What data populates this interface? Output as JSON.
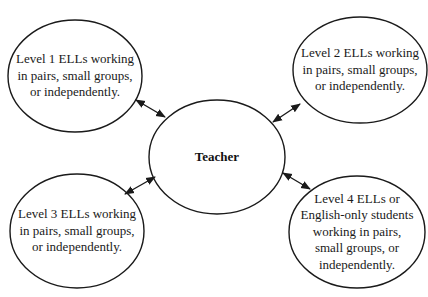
{
  "diagram": {
    "type": "hub-and-spoke",
    "stroke_color": "#1a1a1a",
    "background": "#ffffff",
    "center": {
      "label": "Teacher",
      "cx": 217,
      "cy": 157,
      "rx": 68,
      "ry": 57
    },
    "nodes": [
      {
        "id": "level-1",
        "lines": [
          "Level 1 ELLs working",
          "in pairs, small groups,",
          "or independently."
        ],
        "cx": 75,
        "cy": 76,
        "rx": 67,
        "ry": 56
      },
      {
        "id": "level-2",
        "lines": [
          "Level 2 ELLs working",
          "in pairs, small groups,",
          "or independently."
        ],
        "cx": 360,
        "cy": 70,
        "rx": 67,
        "ry": 53
      },
      {
        "id": "level-3",
        "lines": [
          "Level 3 ELLs working",
          "in pairs, small groups,",
          "or independently."
        ],
        "cx": 77,
        "cy": 231,
        "rx": 67,
        "ry": 57
      },
      {
        "id": "level-4",
        "lines": [
          "Level 4 ELLs or",
          "English-only students",
          "working in pairs,",
          "small groups, or",
          "independently."
        ],
        "cx": 357,
        "cy": 232,
        "rx": 68,
        "ry": 56
      }
    ],
    "edges": [
      {
        "from": "level-1",
        "to": "center",
        "x1": 136,
        "y1": 100,
        "x2": 165,
        "y2": 117,
        "bidirectional": true
      },
      {
        "from": "level-2",
        "to": "center",
        "x1": 300,
        "y1": 104,
        "x2": 273,
        "y2": 122,
        "bidirectional": true
      },
      {
        "from": "level-3",
        "to": "center",
        "x1": 125,
        "y1": 194,
        "x2": 155,
        "y2": 177,
        "bidirectional": true
      },
      {
        "from": "level-4",
        "to": "center",
        "x1": 310,
        "y1": 189,
        "x2": 283,
        "y2": 173,
        "bidirectional": true
      }
    ]
  }
}
